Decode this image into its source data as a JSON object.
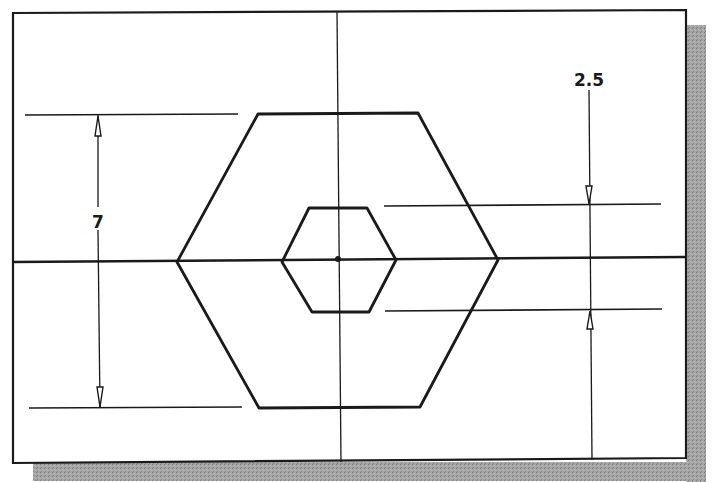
{
  "drawing": {
    "type": "cad-sketch",
    "background": "#ffffff",
    "line_color": "#1a1a1a",
    "shadow_color": "#9a9a9a",
    "frame": {
      "x1": 13,
      "y1": 12,
      "x2": 686,
      "y2": 462
    },
    "shadow_offset": 20
  },
  "dimensions": {
    "overall_height": {
      "label": "7",
      "value": 7
    },
    "inner_height": {
      "label": "2.5",
      "value": 2.5
    }
  },
  "shapes": {
    "outer_hexagon": {
      "label": "outer-hexagon",
      "points": "258,114 418,113 498,260 420,407 259,408 177,262"
    },
    "inner_hexagon": {
      "label": "inner-hexagon",
      "points": "309,208 367,208 396,260 369,312 312,312 282,262"
    }
  },
  "centerlines": {
    "horizontal": {
      "x1": 13,
      "y1": 262,
      "x2": 686,
      "y2": 257
    },
    "vertical": {
      "x1": 337,
      "y1": 12,
      "x2": 341,
      "y2": 462
    }
  }
}
